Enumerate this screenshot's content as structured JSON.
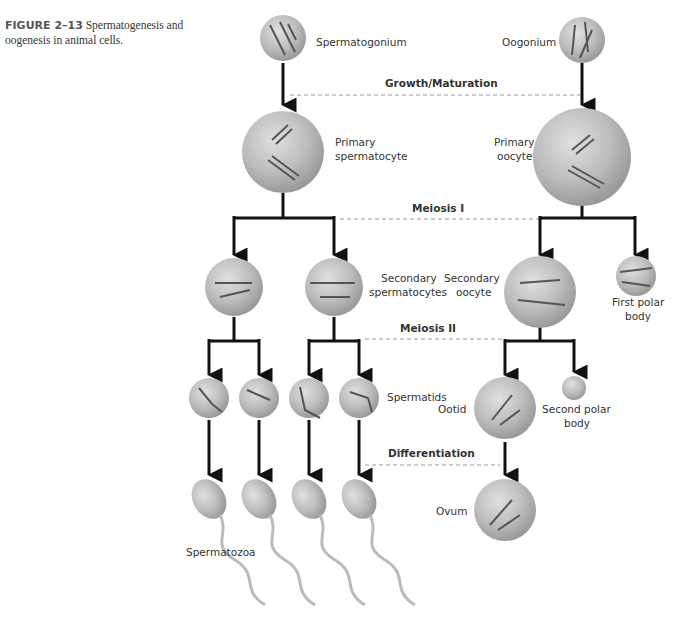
{
  "caption": {
    "figure_label": "FIGURE 2–13",
    "text": "Spermatogenesis and oogenesis in animal cells."
  },
  "stages": {
    "growth": "Growth/Maturation",
    "meiosis1": "Meiosis I",
    "meiosis2": "Meiosis II",
    "differentiation": "Differentiation"
  },
  "labels": {
    "spermatogonium": "Spermatogonium",
    "oogonium": "Oogonium",
    "primary_sperm_1": "Primary",
    "primary_sperm_2": "spermatocyte",
    "primary_oo_1": "Primary",
    "primary_oo_2": "oocyte",
    "secondary_sperm_1": "Secondary",
    "secondary_sperm_2": "spermatocytes",
    "secondary_oo_1": "Secondary",
    "secondary_oo_2": "oocyte",
    "first_polar_1": "First polar",
    "first_polar_2": "body",
    "spermatids": "Spermatids",
    "ootid": "Ootid",
    "second_polar_1": "Second polar",
    "second_polar_2": "body",
    "ovum": "Ovum",
    "spermatozoa": "Spermatozoa"
  },
  "colors": {
    "cell_fill": "#bdbdbd",
    "arrow": "#111111",
    "dashed": "#999999"
  }
}
